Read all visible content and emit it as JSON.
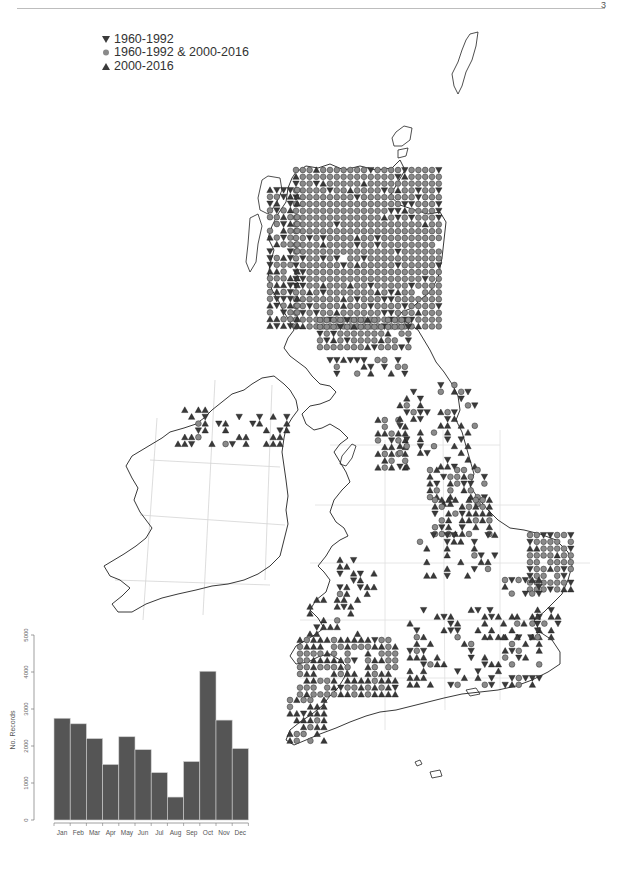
{
  "page": {
    "page_number": "3"
  },
  "legend": {
    "items": [
      {
        "symbol": "triangle-down",
        "label": "1960-1992"
      },
      {
        "symbol": "circle",
        "label": "1960-1992 & 2000-2016"
      },
      {
        "symbol": "triangle-up",
        "label": "2000-2016"
      }
    ]
  },
  "colors": {
    "triangle_fill": "#3a3a3a",
    "circle_fill": "#8a8a8a",
    "marker_stroke": "#111111",
    "coast": "#222222",
    "grid": "#cfcfcf",
    "bar_fill": "#555555",
    "bar_stroke": "#cfcfcf",
    "axis": "#777777"
  },
  "chart_data": [
    {
      "type": "bar",
      "title": "",
      "xlabel": "",
      "ylabel": "No. Records",
      "categories": [
        "Jan",
        "Feb",
        "Mar",
        "Apr",
        "May",
        "Jun",
        "Jul",
        "Aug",
        "Sep",
        "Oct",
        "Nov",
        "Dec"
      ],
      "values": [
        2750,
        2600,
        2200,
        1500,
        2250,
        1900,
        1280,
        620,
        1580,
        4020,
        2700,
        1930
      ],
      "yticks": [
        0,
        1000,
        2000,
        3000,
        4000,
        5000
      ],
      "ylim": [
        0,
        5000
      ],
      "grid": false
    },
    {
      "type": "scatter",
      "title": "Distribution map (10 km squares), Britain & Ireland",
      "legend": [
        "1960-1992",
        "1960-1992 & 2000-2016",
        "2000-2016"
      ],
      "legend_position": "top-left",
      "note": "Dense 'both periods' circles across Scottish Highlands and East Anglia; scattered 2000-2016 triangles across England, Wales and Northern Ireland; Ireland south of north largely empty."
    }
  ]
}
